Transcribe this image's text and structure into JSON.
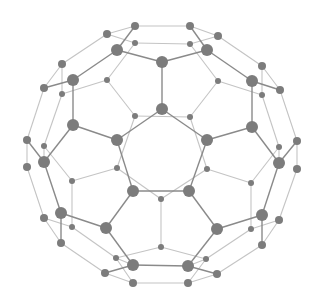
{
  "diagram": {
    "title": "",
    "type": "molecular-structure",
    "colors": {
      "background": "#ffffff",
      "node": "#7c7c7c",
      "front_edge": "#8a8a8a",
      "back_edge": "#c4c4c4"
    },
    "nodes": [
      {
        "id": "t1",
        "x": 135,
        "y": 26,
        "r": 4
      },
      {
        "id": "t2",
        "x": 190,
        "y": 26,
        "r": 4
      },
      {
        "id": "t3",
        "x": 107,
        "y": 34,
        "r": 4
      },
      {
        "id": "t4",
        "x": 218,
        "y": 36,
        "r": 4
      },
      {
        "id": "t5",
        "x": 135,
        "y": 43,
        "r": 3
      },
      {
        "id": "t6",
        "x": 190,
        "y": 44,
        "r": 3
      },
      {
        "id": "t7",
        "x": 117,
        "y": 50,
        "r": 6
      },
      {
        "id": "t8",
        "x": 207,
        "y": 50,
        "r": 6
      },
      {
        "id": "c1",
        "x": 162,
        "y": 62,
        "r": 6
      },
      {
        "id": "l1",
        "x": 62,
        "y": 64,
        "r": 4
      },
      {
        "id": "r1",
        "x": 262,
        "y": 66,
        "r": 4
      },
      {
        "id": "l2",
        "x": 73,
        "y": 80,
        "r": 6
      },
      {
        "id": "r2",
        "x": 252,
        "y": 81,
        "r": 6
      },
      {
        "id": "l3",
        "x": 107,
        "y": 80,
        "r": 3
      },
      {
        "id": "r3",
        "x": 218,
        "y": 81,
        "r": 3
      },
      {
        "id": "l4",
        "x": 44,
        "y": 88,
        "r": 4
      },
      {
        "id": "r4",
        "x": 280,
        "y": 90,
        "r": 4
      },
      {
        "id": "l5",
        "x": 62,
        "y": 94,
        "r": 3
      },
      {
        "id": "r5",
        "x": 262,
        "y": 95,
        "r": 3
      },
      {
        "id": "c2",
        "x": 162,
        "y": 109,
        "r": 6
      },
      {
        "id": "l6",
        "x": 135,
        "y": 116,
        "r": 3
      },
      {
        "id": "r6",
        "x": 190,
        "y": 117,
        "r": 3
      },
      {
        "id": "l7",
        "x": 73,
        "y": 125,
        "r": 6
      },
      {
        "id": "r7",
        "x": 252,
        "y": 127,
        "r": 6
      },
      {
        "id": "l8",
        "x": 117,
        "y": 140,
        "r": 6
      },
      {
        "id": "r8",
        "x": 207,
        "y": 140,
        "r": 6
      },
      {
        "id": "l9",
        "x": 27,
        "y": 140,
        "r": 4
      },
      {
        "id": "r9",
        "x": 297,
        "y": 141,
        "r": 4
      },
      {
        "id": "l10",
        "x": 44,
        "y": 146,
        "r": 3
      },
      {
        "id": "r10",
        "x": 279,
        "y": 147,
        "r": 3
      },
      {
        "id": "l11",
        "x": 44,
        "y": 162,
        "r": 6
      },
      {
        "id": "r11",
        "x": 279,
        "y": 163,
        "r": 6
      },
      {
        "id": "l12",
        "x": 27,
        "y": 167,
        "r": 4
      },
      {
        "id": "r12",
        "x": 297,
        "y": 169,
        "r": 4
      },
      {
        "id": "l13",
        "x": 117,
        "y": 168,
        "r": 3
      },
      {
        "id": "r13",
        "x": 207,
        "y": 169,
        "r": 3
      },
      {
        "id": "l14",
        "x": 72,
        "y": 181,
        "r": 3
      },
      {
        "id": "r14",
        "x": 251,
        "y": 183,
        "r": 3
      },
      {
        "id": "b1",
        "x": 133,
        "y": 191,
        "r": 6
      },
      {
        "id": "b2",
        "x": 189,
        "y": 191,
        "r": 6
      },
      {
        "id": "b3",
        "x": 161,
        "y": 199,
        "r": 3
      },
      {
        "id": "l15",
        "x": 61,
        "y": 213,
        "r": 6
      },
      {
        "id": "r15",
        "x": 262,
        "y": 215,
        "r": 6
      },
      {
        "id": "l16",
        "x": 44,
        "y": 218,
        "r": 4
      },
      {
        "id": "r16",
        "x": 279,
        "y": 220,
        "r": 4
      },
      {
        "id": "l17",
        "x": 106,
        "y": 228,
        "r": 6
      },
      {
        "id": "r17",
        "x": 217,
        "y": 229,
        "r": 6
      },
      {
        "id": "l18",
        "x": 72,
        "y": 227,
        "r": 3
      },
      {
        "id": "r18",
        "x": 251,
        "y": 229,
        "r": 3
      },
      {
        "id": "l19",
        "x": 61,
        "y": 243,
        "r": 4
      },
      {
        "id": "r19",
        "x": 262,
        "y": 245,
        "r": 4
      },
      {
        "id": "b4",
        "x": 161,
        "y": 247,
        "r": 3
      },
      {
        "id": "l20",
        "x": 116,
        "y": 258,
        "r": 3
      },
      {
        "id": "r20",
        "x": 206,
        "y": 259,
        "r": 3
      },
      {
        "id": "b5",
        "x": 133,
        "y": 265,
        "r": 6
      },
      {
        "id": "b6",
        "x": 188,
        "y": 266,
        "r": 6
      },
      {
        "id": "l21",
        "x": 105,
        "y": 273,
        "r": 4
      },
      {
        "id": "r21",
        "x": 217,
        "y": 274,
        "r": 4
      },
      {
        "id": "b7",
        "x": 133,
        "y": 283,
        "r": 4
      },
      {
        "id": "b8",
        "x": 188,
        "y": 283,
        "r": 4
      }
    ],
    "front_edges": [
      [
        "t1",
        "t7"
      ],
      [
        "t2",
        "t8"
      ],
      [
        "t7",
        "c1"
      ],
      [
        "t8",
        "c1"
      ],
      [
        "c1",
        "c2"
      ],
      [
        "t7",
        "l2"
      ],
      [
        "t8",
        "r2"
      ],
      [
        "l2",
        "l7"
      ],
      [
        "r2",
        "r7"
      ],
      [
        "l7",
        "l8"
      ],
      [
        "r7",
        "r8"
      ],
      [
        "c2",
        "l8"
      ],
      [
        "c2",
        "r8"
      ],
      [
        "l8",
        "b1"
      ],
      [
        "r8",
        "b2"
      ],
      [
        "b1",
        "b2"
      ],
      [
        "l7",
        "l11"
      ],
      [
        "r7",
        "r11"
      ],
      [
        "l11",
        "l15"
      ],
      [
        "r11",
        "r15"
      ],
      [
        "l15",
        "l17"
      ],
      [
        "r15",
        "r17"
      ],
      [
        "b1",
        "l17"
      ],
      [
        "b2",
        "r17"
      ],
      [
        "l17",
        "b5"
      ],
      [
        "r17",
        "b6"
      ],
      [
        "b5",
        "b6"
      ],
      [
        "l15",
        "l19"
      ],
      [
        "r15",
        "r19"
      ],
      [
        "b5",
        "l21"
      ],
      [
        "b6",
        "r21"
      ],
      [
        "l2",
        "l4"
      ],
      [
        "r2",
        "r4"
      ],
      [
        "l9",
        "l11"
      ],
      [
        "r9",
        "r11"
      ]
    ],
    "back_edges": [
      [
        "t1",
        "t2"
      ],
      [
        "t1",
        "t3"
      ],
      [
        "t2",
        "t4"
      ],
      [
        "t5",
        "t6"
      ],
      [
        "t3",
        "t5"
      ],
      [
        "t4",
        "t6"
      ],
      [
        "t3",
        "l1"
      ],
      [
        "t4",
        "r1"
      ],
      [
        "l1",
        "l4"
      ],
      [
        "r1",
        "r4"
      ],
      [
        "l1",
        "l5"
      ],
      [
        "r1",
        "r5"
      ],
      [
        "t5",
        "l3"
      ],
      [
        "t6",
        "r3"
      ],
      [
        "l3",
        "l5"
      ],
      [
        "r3",
        "r5"
      ],
      [
        "l3",
        "l6"
      ],
      [
        "r3",
        "r6"
      ],
      [
        "l6",
        "r6"
      ],
      [
        "l6",
        "l13"
      ],
      [
        "r6",
        "r13"
      ],
      [
        "l4",
        "l9"
      ],
      [
        "r4",
        "r9"
      ],
      [
        "l5",
        "l10"
      ],
      [
        "r5",
        "r10"
      ],
      [
        "l9",
        "l12"
      ],
      [
        "r9",
        "r12"
      ],
      [
        "l10",
        "l14"
      ],
      [
        "r10",
        "r14"
      ],
      [
        "l10",
        "l11"
      ],
      [
        "r10",
        "r11"
      ],
      [
        "l13",
        "l14"
      ],
      [
        "r13",
        "r14"
      ],
      [
        "l13",
        "b3"
      ],
      [
        "r13",
        "b3"
      ],
      [
        "b3",
        "b4"
      ],
      [
        "l12",
        "l16"
      ],
      [
        "r12",
        "r16"
      ],
      [
        "l14",
        "l18"
      ],
      [
        "r14",
        "r18"
      ],
      [
        "l16",
        "l19"
      ],
      [
        "r16",
        "r19"
      ],
      [
        "l16",
        "l18"
      ],
      [
        "r16",
        "r18"
      ],
      [
        "l18",
        "l20"
      ],
      [
        "r18",
        "r20"
      ],
      [
        "l20",
        "b4"
      ],
      [
        "r20",
        "b4"
      ],
      [
        "l19",
        "l21"
      ],
      [
        "r19",
        "r21"
      ],
      [
        "l20",
        "b7"
      ],
      [
        "r20",
        "b8"
      ],
      [
        "l21",
        "b7"
      ],
      [
        "r21",
        "b8"
      ],
      [
        "b7",
        "b8"
      ],
      [
        "l20",
        "b5"
      ],
      [
        "r20",
        "b6"
      ]
    ]
  }
}
